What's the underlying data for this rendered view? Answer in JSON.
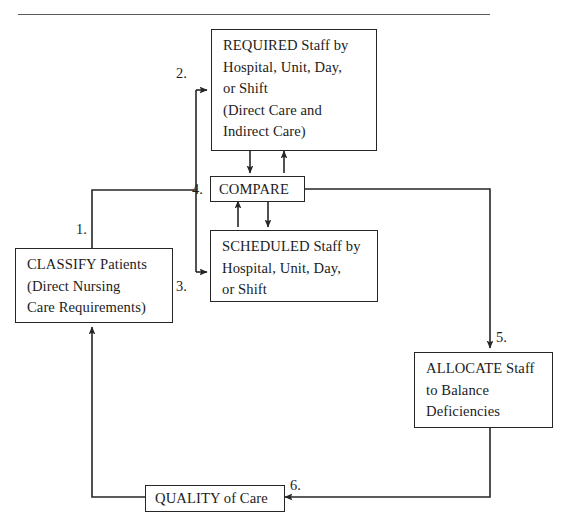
{
  "diagram": {
    "title_rule": "horizontal-divider",
    "boxes": [
      {
        "id": "required",
        "name": "required-staff-box",
        "lines": [
          "REQUIRED Staff by",
          "Hospital, Unit, Day,",
          "or Shift",
          "(Direct Care and",
          "Indirect Care)"
        ]
      },
      {
        "id": "compare",
        "name": "compare-box",
        "lines": [
          "COMPARE"
        ]
      },
      {
        "id": "scheduled",
        "name": "scheduled-staff-box",
        "lines": [
          "SCHEDULED Staff by",
          "Hospital, Unit, Day,",
          "or Shift"
        ]
      },
      {
        "id": "classify",
        "name": "classify-patients-box",
        "lines": [
          "CLASSIFY Patients",
          "(Direct Nursing",
          "Care Requirements)"
        ]
      },
      {
        "id": "allocate",
        "name": "allocate-staff-box",
        "lines": [
          "ALLOCATE Staff",
          "to Balance",
          "Deficiencies"
        ]
      },
      {
        "id": "quality",
        "name": "quality-of-care-box",
        "lines": [
          "QUALITY of Care"
        ]
      }
    ],
    "steps": [
      {
        "id": "s1",
        "label": "1."
      },
      {
        "id": "s2",
        "label": "2."
      },
      {
        "id": "s3",
        "label": "3."
      },
      {
        "id": "s4",
        "label": "4."
      },
      {
        "id": "s5",
        "label": "5."
      },
      {
        "id": "s6",
        "label": "6."
      }
    ],
    "colors": {
      "stroke": "#262626",
      "rule": "#5a5a5a",
      "text": "#1c1c1c",
      "background": "#ffffff"
    }
  }
}
